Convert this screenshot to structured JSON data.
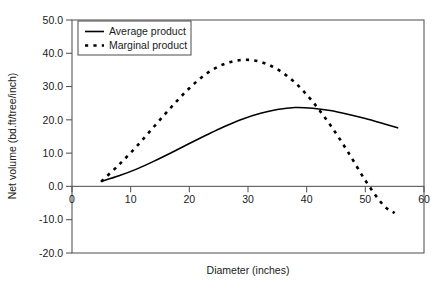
{
  "chart_data": {
    "type": "line",
    "title": "",
    "xlabel": "Diameter (inches)",
    "ylabel": "Net volume (bd.ft/tree/inch)",
    "xlim": [
      0,
      60
    ],
    "ylim": [
      -20.0,
      50.0
    ],
    "xticks": [
      0,
      10,
      20,
      30,
      40,
      50,
      60
    ],
    "xtick_labels": [
      "0",
      "10",
      "20",
      "30",
      "40",
      "50",
      "60"
    ],
    "yticks": [
      -20.0,
      -10.0,
      0.0,
      10.0,
      20.0,
      30.0,
      40.0,
      50.0
    ],
    "ytick_labels": [
      "-20.0",
      "-10.0",
      "0.0",
      "10.0",
      "20.0",
      "30.0",
      "40.0",
      "50.0"
    ],
    "grid": false,
    "legend_position": "upper left",
    "series": [
      {
        "name": "Average product",
        "style": "solid",
        "color": "#000000",
        "x": [
          5,
          8,
          11,
          14,
          17,
          20,
          23,
          26,
          29,
          32,
          35,
          38,
          41,
          44,
          47,
          50,
          53,
          55.5
        ],
        "y": [
          1.5,
          3.2,
          5.2,
          7.6,
          10.2,
          12.9,
          15.5,
          18.0,
          20.2,
          21.9,
          23.1,
          23.7,
          23.5,
          22.8,
          21.7,
          20.4,
          18.9,
          17.6
        ]
      },
      {
        "name": "Marginal product",
        "style": "dashed",
        "color": "#000000",
        "x": [
          5,
          8,
          11,
          14,
          17,
          20,
          23,
          26,
          29,
          32,
          35,
          38,
          41,
          44,
          47,
          50,
          53,
          55
        ],
        "y": [
          1.5,
          6.5,
          12.0,
          18.0,
          24.0,
          29.5,
          34.0,
          36.8,
          38.0,
          37.5,
          35.2,
          31.2,
          25.5,
          18.5,
          10.5,
          1.8,
          -5.5,
          -8.0
        ]
      }
    ],
    "annotations": []
  },
  "legend": {
    "entries": [
      {
        "label": "Average product",
        "style": "solid"
      },
      {
        "label": "Marginal product",
        "style": "dashed"
      }
    ]
  }
}
